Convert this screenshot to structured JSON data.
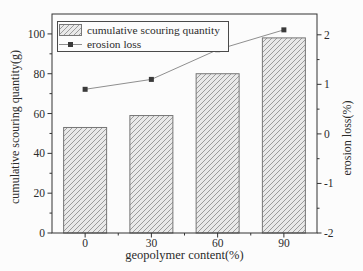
{
  "figure": {
    "background": "#fcfcfc"
  },
  "legend": {
    "position": "top-left",
    "items": [
      {
        "label": "cumulative scouring quantity",
        "glyph": "hatched-bar-swatch"
      },
      {
        "label": "erosion loss",
        "glyph": "line-with-square-marker"
      }
    ]
  },
  "chart_data": {
    "type": "combo",
    "categories": [
      "0",
      "30",
      "60",
      "90"
    ],
    "series": [
      {
        "name": "cumulative scouring quantity",
        "type": "bar",
        "axis": "left",
        "values": [
          53,
          59,
          80,
          98
        ]
      },
      {
        "name": "erosion loss",
        "type": "line",
        "axis": "right",
        "values": [
          0.9,
          1.1,
          1.7,
          2.1
        ]
      }
    ],
    "xlabel": "geopolymer content(%)",
    "ylabel_left": "cumulative scouring quantity(g)",
    "ylabel_right": "erosion loss(%)",
    "left_axis": {
      "min": 0,
      "max": 110,
      "major_ticks": [
        0,
        20,
        40,
        60,
        80,
        100
      ],
      "minor_ticks": [
        10,
        30,
        50,
        70,
        90
      ]
    },
    "right_axis": {
      "min": -2,
      "max": 2.42,
      "major_ticks": [
        -2,
        -1,
        0,
        1,
        2
      ],
      "minor_ticks": [
        -1.5,
        -0.5,
        0.5,
        1.5
      ]
    },
    "x_minor_fractions": [
      0.25,
      0.5,
      0.75
    ],
    "grid": false,
    "legend_position": "top-left",
    "colors": {
      "bar_fill": "#e9e9e9",
      "bar_hatch": "#9c9c9c",
      "bar_edge": "#767676",
      "line": "#8f8f8f",
      "marker": "#3a3a3a",
      "axis": "#333333",
      "text": "#2b2b2b"
    }
  }
}
